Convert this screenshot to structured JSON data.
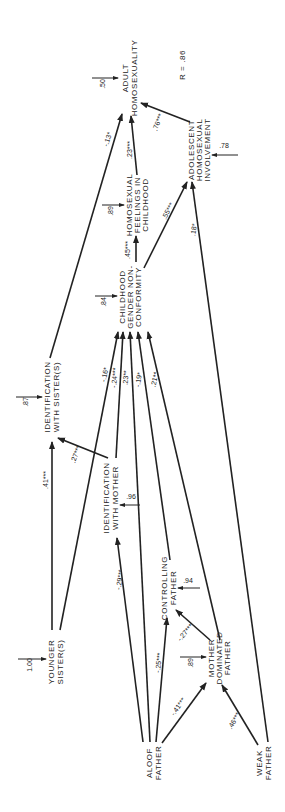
{
  "diagram": {
    "fit_statistic": "R = .86",
    "nodes": [
      {
        "id": "adult_homosexuality",
        "lines": [
          "ADULT",
          "HOMOSEXUALITY"
        ],
        "residual": ".50"
      },
      {
        "id": "adolescent_homosexual_involvement",
        "lines": [
          "ADOLESCENT",
          "HOMOSEXUAL",
          "INVOLVEMENT"
        ],
        "residual": ".78"
      },
      {
        "id": "homosexual_feelings_childhood",
        "lines": [
          "HOMOSEXUAL",
          "FEELINGS IN",
          "CHILDHOOD"
        ],
        "residual": ".89"
      },
      {
        "id": "childhood_gender_nonconformity",
        "lines": [
          "CHILDHOOD",
          "GENDER NON-",
          "CONFORMITY"
        ],
        "residual": ".84"
      },
      {
        "id": "identification_with_sisters",
        "lines": [
          "IDENTIFICATION",
          "WITH SISTER(S)"
        ],
        "residual": ".87"
      },
      {
        "id": "identification_with_mother",
        "lines": [
          "IDENTIFICATION",
          "WITH MOTHER"
        ],
        "residual": ".96"
      },
      {
        "id": "controlling_father",
        "lines": [
          "CONTROLLING",
          "FATHER"
        ],
        "residual": ".94"
      },
      {
        "id": "mother_dominated_father",
        "lines": [
          "MOTHER",
          "DOMINATED",
          "FATHER"
        ],
        "residual": ".89"
      },
      {
        "id": "younger_sisters",
        "lines": [
          "YOUNGER",
          "SISTER(S)"
        ],
        "residual": "1.00"
      },
      {
        "id": "aloof_father",
        "lines": [
          "ALOOF",
          "FATHER"
        ],
        "residual": ""
      },
      {
        "id": "weak_father",
        "lines": [
          "WEAK",
          "FATHER"
        ],
        "residual": ""
      }
    ],
    "edges": [
      {
        "from": "adolescent_homosexual_involvement",
        "to": "adult_homosexuality",
        "coef": ".76***"
      },
      {
        "from": "homosexual_feelings_childhood",
        "to": "adult_homosexuality",
        "coef": ".23***"
      },
      {
        "from": "identification_with_sisters",
        "to": "adult_homosexuality",
        "coef": "-.13*"
      },
      {
        "from": "childhood_gender_nonconformity",
        "to": "homosexual_feelings_childhood",
        "coef": ".45***"
      },
      {
        "from": "childhood_gender_nonconformity",
        "to": "adolescent_homosexual_involvement",
        "coef": ".55***"
      },
      {
        "from": "weak_father",
        "to": "adolescent_homosexual_involvement",
        "coef": ".18*"
      },
      {
        "from": "younger_sisters",
        "to": "childhood_gender_nonconformity",
        "coef": "-.16*"
      },
      {
        "from": "identification_with_mother",
        "to": "childhood_gender_nonconformity",
        "coef": "-.24***"
      },
      {
        "from": "aloof_father",
        "to": "childhood_gender_nonconformity",
        "coef": ".23**"
      },
      {
        "from": "controlling_father",
        "to": "childhood_gender_nonconformity",
        "coef": "-.19*"
      },
      {
        "from": "mother_dominated_father",
        "to": "childhood_gender_nonconformity",
        "coef": ".21**"
      },
      {
        "from": "younger_sisters",
        "to": "identification_with_sisters",
        "coef": ".41***"
      },
      {
        "from": "identification_with_mother",
        "to": "identification_with_sisters",
        "coef": ".27***"
      },
      {
        "from": "aloof_father",
        "to": "identification_with_mother",
        "coef": "-.29***"
      },
      {
        "from": "aloof_father",
        "to": "controlling_father",
        "coef": "-.25***"
      },
      {
        "from": "mother_dominated_father",
        "to": "controlling_father",
        "coef": "-.27***"
      },
      {
        "from": "aloof_father",
        "to": "mother_dominated_father",
        "coef": "-.41***"
      },
      {
        "from": "weak_father",
        "to": "mother_dominated_father",
        "coef": ".46***"
      }
    ]
  }
}
